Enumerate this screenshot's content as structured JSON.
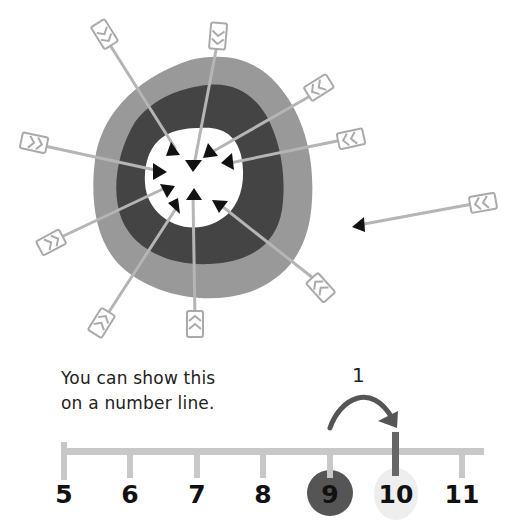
{
  "figure": {
    "colors": {
      "outer_ring": "#999999",
      "middle_ring": "#444444",
      "bullseye": "#ffffff",
      "arrow_shaft": "#b5b5b5",
      "arrow_head": "#111111",
      "number_line": "#c8c8c8",
      "highlight_start": "#555555",
      "highlight_end": "#eeeeee",
      "jump_arrow": "#555555"
    },
    "target": {
      "arrows_hit": 10,
      "arrows_missed": 1
    }
  },
  "caption": {
    "line1": "You can show this",
    "line2": "on a number line."
  },
  "number_line": {
    "ticks": [
      {
        "label": "5",
        "x": 64
      },
      {
        "label": "6",
        "x": 130
      },
      {
        "label": "7",
        "x": 197
      },
      {
        "label": "8",
        "x": 263
      },
      {
        "label": "9",
        "x": 330
      },
      {
        "label": "10",
        "x": 396
      },
      {
        "label": "11",
        "x": 462
      }
    ],
    "start_value": "9",
    "end_value": "10",
    "jump": {
      "label": "1",
      "from": "9",
      "to": "10"
    }
  }
}
